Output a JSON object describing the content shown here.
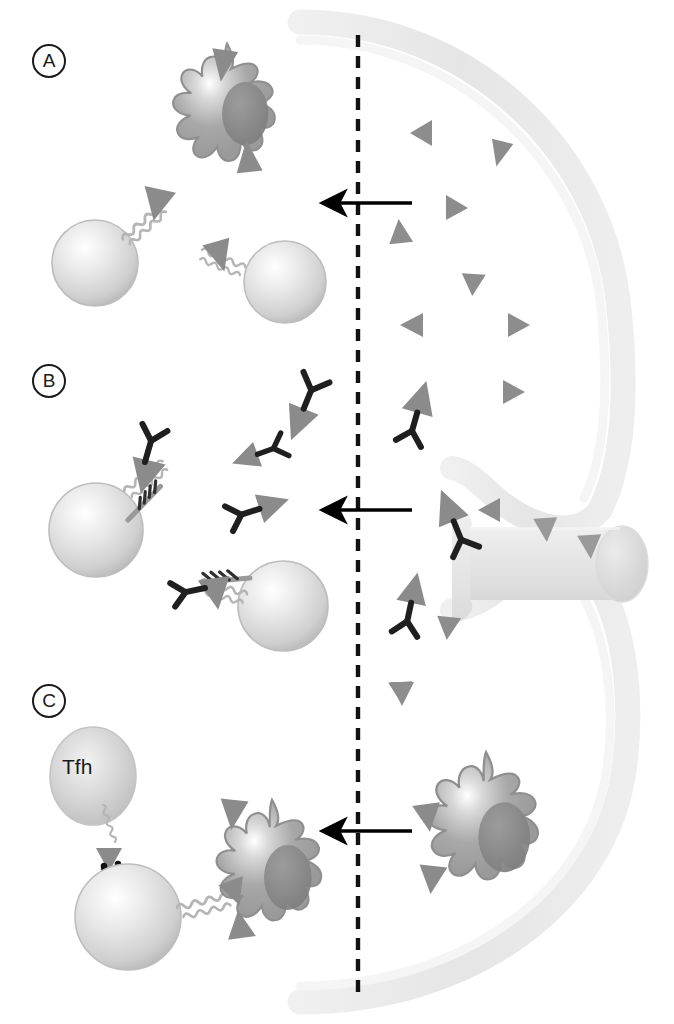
{
  "figure": {
    "width": 674,
    "height": 1024,
    "background": "#ffffff"
  },
  "panels": [
    {
      "id": "A",
      "label": "A",
      "label_x": 32,
      "label_y": 44
    },
    {
      "id": "B",
      "label": "B",
      "label_x": 32,
      "label_y": 364
    },
    {
      "id": "C",
      "label": "C",
      "label_x": 32,
      "label_y": 684
    }
  ],
  "annotations": {
    "tfh_label": "Tfh"
  },
  "colors": {
    "capsule": "#e6e6e6",
    "capsule_edge": "#dcdcdc",
    "vessel": "#e9e9e9",
    "antigen_triangle": "#8c8c8c",
    "antigen_triangle_dark": "#7a7a7a",
    "antibody": "#1f1f1f",
    "dendritic_cell_body": "#a2a2a2",
    "dendritic_cell_nucleus": "#8a8a8a",
    "b_cell": "#d8d8d8",
    "tfh_cell": "#cfcfcf",
    "receptor": "#b8b8b8",
    "arrow": "#000000",
    "dashed_line": "#111111",
    "outline": "#1a1a1a",
    "text": "#1a1a1a"
  },
  "dashed_divider": {
    "x": 358,
    "y_start": 35,
    "y_end": 992,
    "dash": 12,
    "gap": 9,
    "width": 4
  },
  "arrows": [
    {
      "name": "arrow-panel-a",
      "x_tail": 412,
      "x_head": 320,
      "y": 203
    },
    {
      "name": "arrow-panel-b",
      "x_tail": 412,
      "x_head": 320,
      "y": 510
    },
    {
      "name": "arrow-panel-c",
      "x_tail": 412,
      "x_head": 320,
      "y": 831
    }
  ],
  "capsule": {
    "description": "Lymph node capsule drawn as thick light-gray arc open on the left side",
    "center_x": 300,
    "top_radius": 330,
    "thickness": 26
  },
  "vessel": {
    "description": "Afferent lymphatic vessel entering node at mid-right, drawn as a cylinder",
    "cylinder_cx": 622,
    "cylinder_cy": 563,
    "cylinder_rx": 26,
    "cylinder_ry": 37
  },
  "panel_a": {
    "name": "panel-a-antigen-drainage",
    "dendritic_cells": [
      {
        "cx": 227,
        "cy": 108,
        "r": 62,
        "bound_antigens": 2
      }
    ],
    "b_cells": [
      {
        "cx": 95,
        "cy": 262,
        "r": 42,
        "receptor_angle": -48
      },
      {
        "cx": 283,
        "cy": 280,
        "r": 40,
        "receptor_angle": 215
      }
    ],
    "free_antigens": [
      {
        "x": 432,
        "y": 131,
        "rot": 200,
        "size": 22
      },
      {
        "x": 501,
        "y": 155,
        "rot": 15,
        "size": 22
      },
      {
        "x": 458,
        "y": 207,
        "rot": 95,
        "size": 23
      },
      {
        "x": 398,
        "y": 232,
        "rot": 5,
        "size": 21
      },
      {
        "x": 472,
        "y": 274,
        "rot": 178,
        "size": 22
      },
      {
        "x": 411,
        "y": 320,
        "rot": 200,
        "size": 22
      },
      {
        "x": 520,
        "y": 322,
        "rot": 92,
        "size": 22
      }
    ]
  },
  "panel_b": {
    "name": "panel-b-immune-complex-transport",
    "b_cells": [
      {
        "cx": 96,
        "cy": 528,
        "r": 46,
        "receptors": 2
      },
      {
        "cx": 281,
        "cy": 604,
        "r": 44,
        "receptors": 2
      }
    ],
    "immune_complexes": [
      {
        "x": 288,
        "y": 418,
        "rot": 20,
        "size": 24
      },
      {
        "x": 243,
        "y": 456,
        "rot": 75,
        "size": 20
      },
      {
        "x": 263,
        "y": 508,
        "rot": 250,
        "size": 22
      },
      {
        "x": 416,
        "y": 403,
        "rot": 195,
        "size": 23
      },
      {
        "x": 446,
        "y": 512,
        "rot": 160,
        "size": 24
      },
      {
        "x": 409,
        "y": 594,
        "rot": 190,
        "size": 22
      }
    ],
    "free_antigens": [
      {
        "x": 513,
        "y": 391,
        "rot": 90,
        "size": 22
      },
      {
        "x": 489,
        "y": 510,
        "rot": 200,
        "size": 23
      },
      {
        "x": 448,
        "y": 628,
        "rot": 0,
        "size": 22
      },
      {
        "x": 400,
        "y": 692,
        "rot": 0,
        "size": 22
      },
      {
        "x": 546,
        "y": 530,
        "rot": 0,
        "size": 24
      },
      {
        "x": 590,
        "y": 545,
        "rot": 0,
        "size": 24
      }
    ]
  },
  "panel_c": {
    "name": "panel-c-fdc-antigen-presentation",
    "tfh_cell": {
      "cx": 92,
      "cy": 775,
      "rx": 42,
      "ry": 48,
      "label": "Tfh"
    },
    "b_cells": [
      {
        "cx": 128,
        "cy": 915,
        "r": 52
      }
    ],
    "dendritic_cells": [
      {
        "cx": 270,
        "cy": 865,
        "r": 62,
        "bound_antigens": 3
      },
      {
        "cx": 485,
        "cy": 820,
        "r": 66,
        "bound_antigens": 3
      }
    ],
    "free_antigens": [
      {
        "x": 400,
        "y": 700,
        "rot": 0,
        "size": 22
      }
    ],
    "synapse": {
      "description": "Tfh-B cell contact via MHC-TCR pair",
      "x": 112,
      "y": 850
    }
  }
}
